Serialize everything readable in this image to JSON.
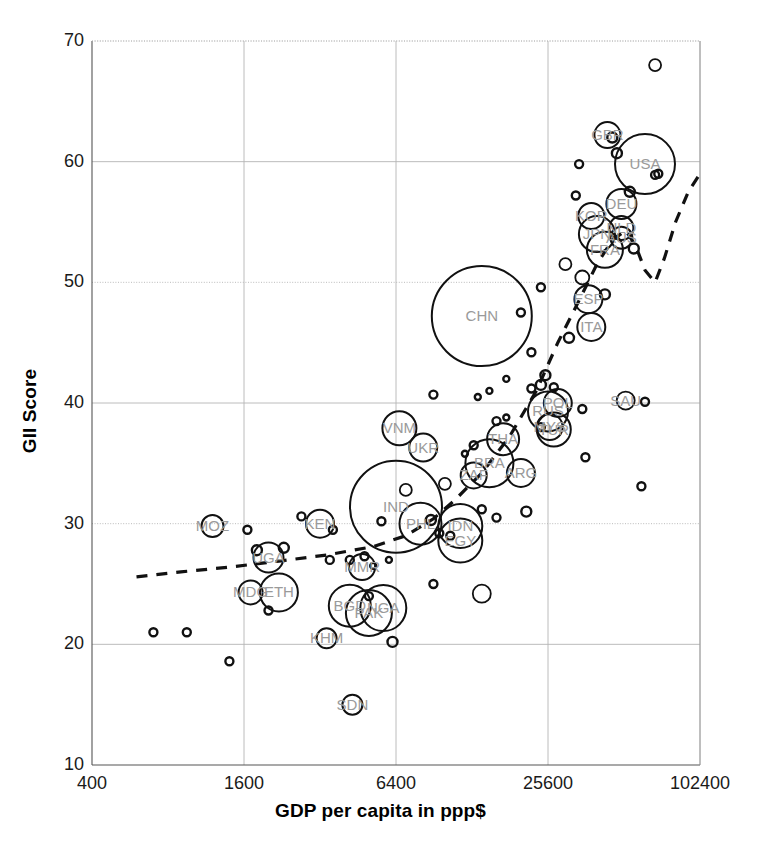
{
  "chart_data": {
    "type": "scatter",
    "title": "",
    "subtitle": "",
    "xlabel": "GDP per capita in ppp$",
    "ylabel": "GII Score",
    "xscale": "log4",
    "yscale": "linear",
    "xlim": [
      400,
      102400
    ],
    "ylim": [
      10,
      70
    ],
    "xticks": [
      400,
      1600,
      6400,
      25600,
      102400
    ],
    "xtick_labels": [
      "400",
      "1600",
      "6400",
      "25600",
      "102400"
    ],
    "yticks": [
      10,
      20,
      30,
      40,
      50,
      60,
      70
    ],
    "ytick_labels": [
      "10",
      "20",
      "30",
      "40",
      "50",
      "60",
      "70"
    ],
    "grid": true,
    "grid_color": "#b4b4b4",
    "legend": "none",
    "marker": "open-circle",
    "size_encoding": "population (bubble area)",
    "series": [
      {
        "name": "Countries",
        "point_color": "#111111",
        "label_color": "#9a9a9a",
        "points": [
          {
            "label": "USA",
            "x": 62000,
            "y": 59.8,
            "r": 30
          },
          {
            "label": "GBR",
            "x": 44000,
            "y": 62.2,
            "r": 13
          },
          {
            "label": "DEU",
            "x": 50000,
            "y": 56.5,
            "r": 15
          },
          {
            "label": "KOR",
            "x": 38000,
            "y": 55.5,
            "r": 13
          },
          {
            "label": "NLD",
            "x": 50000,
            "y": 54.5,
            "r": 12
          },
          {
            "label": "AUS",
            "x": 50000,
            "y": 53.7,
            "r": 11
          },
          {
            "label": "FRA",
            "x": 43000,
            "y": 52.7,
            "r": 18
          },
          {
            "label": "ESP",
            "x": 37000,
            "y": 48.6,
            "r": 14
          },
          {
            "label": "ITA",
            "x": 38000,
            "y": 46.3,
            "r": 14
          },
          {
            "label": "JPN",
            "x": 40000,
            "y": 54.0,
            "r": 18
          },
          {
            "label": "CHN",
            "x": 14000,
            "y": 47.2,
            "r": 50
          },
          {
            "label": "RUS",
            "x": 25600,
            "y": 39.3,
            "r": 20
          },
          {
            "label": "POL",
            "x": 28000,
            "y": 40.0,
            "r": 14
          },
          {
            "label": "SAU",
            "x": 52000,
            "y": 40.2,
            "r": 9
          },
          {
            "label": "MYS",
            "x": 26000,
            "y": 38.0,
            "r": 13
          },
          {
            "label": "TUR",
            "x": 27000,
            "y": 37.8,
            "r": 17
          },
          {
            "label": "THA",
            "x": 17000,
            "y": 37.0,
            "r": 16
          },
          {
            "label": "BRA",
            "x": 15000,
            "y": 35.0,
            "r": 24
          },
          {
            "label": "ARG",
            "x": 20000,
            "y": 34.2,
            "r": 14
          },
          {
            "label": "IND",
            "x": 6400,
            "y": 31.4,
            "r": 46
          },
          {
            "label": "PHL",
            "x": 8000,
            "y": 30.0,
            "r": 21
          },
          {
            "label": "IDN",
            "x": 11500,
            "y": 29.8,
            "r": 22
          },
          {
            "label": "EGY",
            "x": 11500,
            "y": 28.6,
            "r": 22
          },
          {
            "label": "VNM",
            "x": 6600,
            "y": 37.9,
            "r": 17
          },
          {
            "label": "UKR",
            "x": 8200,
            "y": 36.3,
            "r": 14
          },
          {
            "label": "ZAF",
            "x": 13000,
            "y": 34.0,
            "r": 13
          },
          {
            "label": "BGD",
            "x": 4200,
            "y": 23.2,
            "r": 21
          },
          {
            "label": "PAK",
            "x": 5000,
            "y": 22.6,
            "r": 23
          },
          {
            "label": "NGA",
            "x": 5700,
            "y": 23.0,
            "r": 23
          },
          {
            "label": "KEN",
            "x": 3200,
            "y": 30.0,
            "r": 14
          },
          {
            "label": "ETH",
            "x": 2200,
            "y": 24.3,
            "r": 19
          },
          {
            "label": "MDG",
            "x": 1700,
            "y": 24.3,
            "r": 12
          },
          {
            "label": "MOZ",
            "x": 1200,
            "y": 29.8,
            "r": 11
          },
          {
            "label": "UGA",
            "x": 2000,
            "y": 27.2,
            "r": 15
          },
          {
            "label": "MMR",
            "x": 4700,
            "y": 26.4,
            "r": 13
          },
          {
            "label": "KHM",
            "x": 3400,
            "y": 20.5,
            "r": 10
          },
          {
            "label": "SDN",
            "x": 4300,
            "y": 15.0,
            "r": 10
          }
        ],
        "unlabeled_points": [
          {
            "x": 68000,
            "y": 68.0,
            "r": 6
          },
          {
            "x": 46000,
            "y": 62.0,
            "r": 5
          },
          {
            "x": 48000,
            "y": 60.7,
            "r": 5
          },
          {
            "x": 34000,
            "y": 59.8,
            "r": 4
          },
          {
            "x": 70000,
            "y": 59.0,
            "r": 4
          },
          {
            "x": 68000,
            "y": 58.9,
            "r": 4
          },
          {
            "x": 54000,
            "y": 57.5,
            "r": 5
          },
          {
            "x": 33000,
            "y": 57.2,
            "r": 4
          },
          {
            "x": 56000,
            "y": 52.8,
            "r": 5
          },
          {
            "x": 30000,
            "y": 51.5,
            "r": 6
          },
          {
            "x": 35000,
            "y": 50.4,
            "r": 7
          },
          {
            "x": 24000,
            "y": 49.6,
            "r": 4
          },
          {
            "x": 43000,
            "y": 49.0,
            "r": 5
          },
          {
            "x": 20000,
            "y": 47.5,
            "r": 4
          },
          {
            "x": 31000,
            "y": 45.4,
            "r": 5
          },
          {
            "x": 22000,
            "y": 44.2,
            "r": 4
          },
          {
            "x": 25000,
            "y": 42.3,
            "r": 5
          },
          {
            "x": 24000,
            "y": 41.5,
            "r": 5
          },
          {
            "x": 22000,
            "y": 41.2,
            "r": 4
          },
          {
            "x": 27000,
            "y": 41.3,
            "r": 4
          },
          {
            "x": 17500,
            "y": 42.0,
            "r": 3
          },
          {
            "x": 9000,
            "y": 40.7,
            "r": 4
          },
          {
            "x": 15000,
            "y": 41.0,
            "r": 3
          },
          {
            "x": 13500,
            "y": 40.5,
            "r": 3
          },
          {
            "x": 35000,
            "y": 39.5,
            "r": 4
          },
          {
            "x": 62000,
            "y": 40.1,
            "r": 4
          },
          {
            "x": 24000,
            "y": 38.0,
            "r": 4
          },
          {
            "x": 16000,
            "y": 38.5,
            "r": 4
          },
          {
            "x": 17500,
            "y": 38.8,
            "r": 3
          },
          {
            "x": 13000,
            "y": 36.5,
            "r": 4
          },
          {
            "x": 12000,
            "y": 35.8,
            "r": 3
          },
          {
            "x": 36000,
            "y": 35.5,
            "r": 4
          },
          {
            "x": 10000,
            "y": 33.3,
            "r": 6
          },
          {
            "x": 60000,
            "y": 33.1,
            "r": 4
          },
          {
            "x": 21000,
            "y": 31.0,
            "r": 5
          },
          {
            "x": 14000,
            "y": 31.2,
            "r": 4
          },
          {
            "x": 16000,
            "y": 30.5,
            "r": 4
          },
          {
            "x": 8800,
            "y": 30.3,
            "r": 5
          },
          {
            "x": 7000,
            "y": 32.8,
            "r": 6
          },
          {
            "x": 5600,
            "y": 30.2,
            "r": 4
          },
          {
            "x": 2700,
            "y": 30.6,
            "r": 4
          },
          {
            "x": 1650,
            "y": 29.5,
            "r": 4
          },
          {
            "x": 3600,
            "y": 29.5,
            "r": 4
          },
          {
            "x": 1800,
            "y": 27.8,
            "r": 5
          },
          {
            "x": 2300,
            "y": 28.0,
            "r": 5
          },
          {
            "x": 3500,
            "y": 27.0,
            "r": 4
          },
          {
            "x": 4200,
            "y": 27.0,
            "r": 4
          },
          {
            "x": 4800,
            "y": 27.3,
            "r": 4
          },
          {
            "x": 6000,
            "y": 27.0,
            "r": 3
          },
          {
            "x": 5200,
            "y": 26.5,
            "r": 3
          },
          {
            "x": 2000,
            "y": 22.8,
            "r": 4
          },
          {
            "x": 14000,
            "y": 24.2,
            "r": 9
          },
          {
            "x": 9000,
            "y": 25.0,
            "r": 4
          },
          {
            "x": 700,
            "y": 21.0,
            "r": 4
          },
          {
            "x": 950,
            "y": 21.0,
            "r": 4
          },
          {
            "x": 1400,
            "y": 18.6,
            "r": 4
          },
          {
            "x": 6200,
            "y": 20.2,
            "r": 5
          },
          {
            "x": 5000,
            "y": 24.0,
            "r": 4
          },
          {
            "x": 9500,
            "y": 29.2,
            "r": 4
          },
          {
            "x": 10500,
            "y": 29.0,
            "r": 4
          }
        ]
      }
    ],
    "trendline": {
      "style": "dashed",
      "color": "#111111",
      "description": "dashed loess/spline fit rising from left then dipping and spiking at right edge"
    }
  },
  "axes": {
    "x_title": "GDP per capita in ppp$",
    "y_title": "GII Score"
  }
}
